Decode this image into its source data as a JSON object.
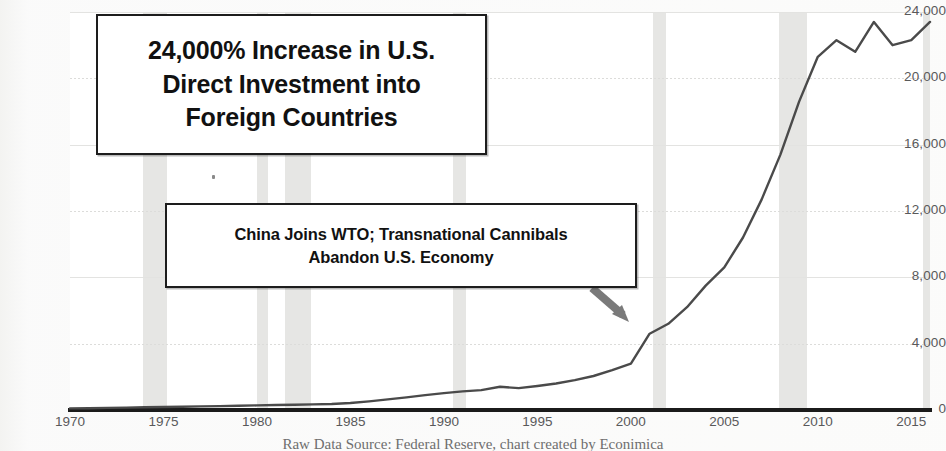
{
  "title_box": {
    "lines": [
      "24,000% Increase in U.S.",
      "Direct Investment into",
      "Foreign Countries"
    ]
  },
  "annotation_box": {
    "lines": [
      "China Joins WTO; Transnational Cannibals",
      "Abandon U.S. Economy"
    ],
    "arrow": "down-right-arrow",
    "points_to_year": 2000
  },
  "caption": "Raw Data Source: Federal Reserve, chart created by Econimica",
  "colors": {
    "line": "#4a4a4a",
    "recession_band": "#e6e6e4",
    "gridline": "#e3e3e1",
    "axis": "#1b1b1b",
    "tick_label": "#59595a",
    "box_border": "#1d1d1d",
    "arrow": "#7a7a7a"
  },
  "chart_data": {
    "type": "line",
    "title": "24,000% Increase in U.S. Direct Investment into Foreign Countries",
    "xlabel": "",
    "ylabel": "",
    "xlim": [
      1970,
      2016
    ],
    "ylim": [
      0,
      24000
    ],
    "xticks": [
      1970,
      1975,
      1980,
      1985,
      1990,
      1995,
      2000,
      2005,
      2010,
      2015
    ],
    "yticks": [
      0,
      4000,
      8000,
      12000,
      16000,
      20000,
      24000
    ],
    "ytick_labels": [
      "0",
      "4,000",
      "8,000",
      "12,000",
      "16,000",
      "20,000",
      "24,000"
    ],
    "grid": true,
    "legend": "none",
    "units": "Billions of U.S. Dollars",
    "series": [
      {
        "name": "U.S. Direct Investment Abroad",
        "x": [
          1970,
          1971,
          1972,
          1973,
          1974,
          1975,
          1976,
          1977,
          1978,
          1979,
          1980,
          1981,
          1982,
          1983,
          1984,
          1985,
          1986,
          1987,
          1988,
          1989,
          1990,
          1991,
          1992,
          1993,
          1994,
          1995,
          1996,
          1997,
          1998,
          1999,
          2000,
          2001,
          2002,
          2003,
          2004,
          2005,
          2006,
          2007,
          2008,
          2009,
          2010,
          2011,
          2012,
          2013,
          2014,
          2015,
          2016
        ],
        "values": [
          95,
          110,
          125,
          145,
          165,
          180,
          200,
          215,
          235,
          260,
          280,
          300,
          320,
          340,
          360,
          420,
          520,
          640,
          760,
          900,
          1020,
          1120,
          1200,
          1400,
          1320,
          1450,
          1600,
          1800,
          2050,
          2400,
          2800,
          4600,
          5200,
          6200,
          7500,
          8600,
          10400,
          12700,
          15400,
          18600,
          21300,
          22300,
          21600,
          23400,
          22000,
          22300,
          23400
        ],
        "style": "solid",
        "width": 2.4,
        "color": "#4a4a4a"
      }
    ],
    "recession_bands": [
      {
        "start": 1973.9,
        "end": 1975.2
      },
      {
        "start": 1980.0,
        "end": 1980.6
      },
      {
        "start": 1981.5,
        "end": 1982.9
      },
      {
        "start": 1990.5,
        "end": 1991.2
      },
      {
        "start": 2001.2,
        "end": 2001.9
      },
      {
        "start": 2007.9,
        "end": 2009.4
      },
      {
        "start": 2015.6,
        "end": 2016.0
      }
    ]
  }
}
